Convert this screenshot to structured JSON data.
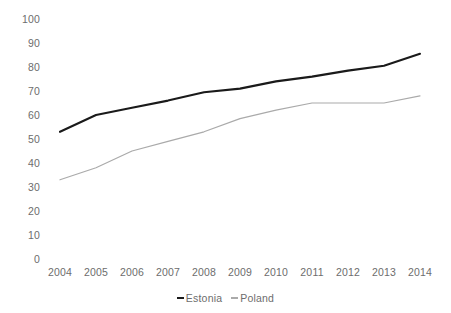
{
  "chart_data": {
    "type": "line",
    "title": "",
    "subtitle": "",
    "xlabel": "",
    "ylabel": "",
    "categories": [
      "2004",
      "2005",
      "2006",
      "2007",
      "2008",
      "2009",
      "2010",
      "2011",
      "2012",
      "2013",
      "2014"
    ],
    "series": [
      {
        "name": "Estonia",
        "color": "#1a1a1a",
        "values": [
          53,
          60,
          63,
          66,
          69.5,
          71,
          74,
          76,
          78.5,
          80.5,
          85.5
        ]
      },
      {
        "name": "Poland",
        "color": "#aaaaaa",
        "values": [
          33,
          38,
          45,
          49,
          53,
          58.5,
          62,
          65,
          65,
          65,
          68
        ]
      }
    ],
    "ylim": [
      0,
      100
    ],
    "ytick_step": 10,
    "ytick_labels": [
      "100",
      "90",
      "80",
      "70",
      "60",
      "50",
      "40",
      "30",
      "20",
      "10",
      "0"
    ],
    "ytick_values": [
      100,
      90,
      80,
      70,
      60,
      50,
      40,
      30,
      20,
      10,
      0
    ],
    "grid": false,
    "axis_lines": false,
    "legend_position": "bottom",
    "legend": [
      {
        "label": "Estonia",
        "color": "#1a1a1a"
      },
      {
        "label": "Poland",
        "color": "#aaaaaa"
      }
    ],
    "tick_label_color": "#6d6d6d",
    "background_color": "#ffffff"
  }
}
